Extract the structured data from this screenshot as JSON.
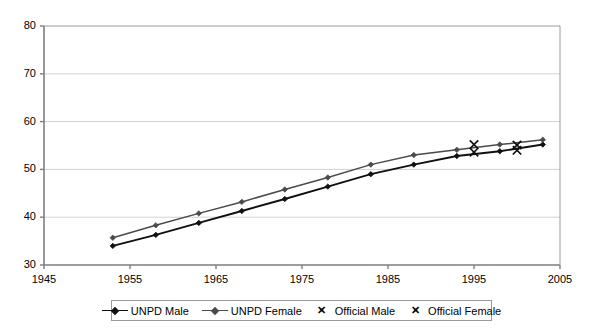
{
  "chart_data": {
    "type": "line",
    "title": "",
    "subtitle": "",
    "xlabel": "",
    "ylabel": "",
    "xlim": [
      1945,
      2005
    ],
    "ylim": [
      30,
      80
    ],
    "xticks": [
      1945,
      1955,
      1965,
      1975,
      1985,
      1995,
      2005
    ],
    "yticks": [
      30,
      40,
      50,
      60,
      70,
      80
    ],
    "grid": "horizontal",
    "legend_position": "bottom",
    "series": [
      {
        "name": "UNPD Male",
        "style": "line-marker",
        "color": "#101010",
        "marker": "diamond",
        "x": [
          1953,
          1958,
          1963,
          1968,
          1973,
          1978,
          1983,
          1988,
          1993,
          1998,
          2003
        ],
        "values": [
          34.0,
          36.3,
          38.8,
          41.3,
          43.8,
          46.4,
          49.0,
          51.0,
          52.8,
          53.8,
          55.2
        ]
      },
      {
        "name": "UNPD Female",
        "style": "line-marker",
        "color": "#4a4a4a",
        "marker": "diamond",
        "x": [
          1953,
          1958,
          1963,
          1968,
          1973,
          1978,
          1983,
          1988,
          1993,
          1998,
          2003
        ],
        "values": [
          35.7,
          38.3,
          40.8,
          43.2,
          45.8,
          48.3,
          51.0,
          53.0,
          54.1,
          55.2,
          56.2
        ]
      },
      {
        "name": "Official Male",
        "style": "marker-only",
        "color": "#101010",
        "marker": "x",
        "x": [
          1995,
          2000
        ],
        "values": [
          53.6,
          54.0
        ]
      },
      {
        "name": "Official Female",
        "style": "marker-only",
        "color": "#101010",
        "marker": "x",
        "x": [
          1995,
          2000
        ],
        "values": [
          55.2,
          55.1
        ]
      }
    ]
  },
  "axes": {
    "y_tick_labels": [
      "80",
      "70",
      "60",
      "50",
      "40",
      "30"
    ],
    "x_tick_labels": [
      "1945",
      "1955",
      "1965",
      "1975",
      "1985",
      "1995",
      "2005"
    ]
  },
  "legend": {
    "items": [
      {
        "label": "UNPD Male",
        "key": "line-diamond-dark",
        "icon": "line-marker-icon"
      },
      {
        "label": "UNPD Female",
        "key": "line-diamond-gray",
        "icon": "line-marker-icon"
      },
      {
        "label": "Official Male",
        "key": "cross",
        "icon": "x-marker-icon",
        "glyph": "✕"
      },
      {
        "label": "Official Female",
        "key": "cross",
        "icon": "x-marker-icon",
        "glyph": "✕"
      }
    ]
  }
}
